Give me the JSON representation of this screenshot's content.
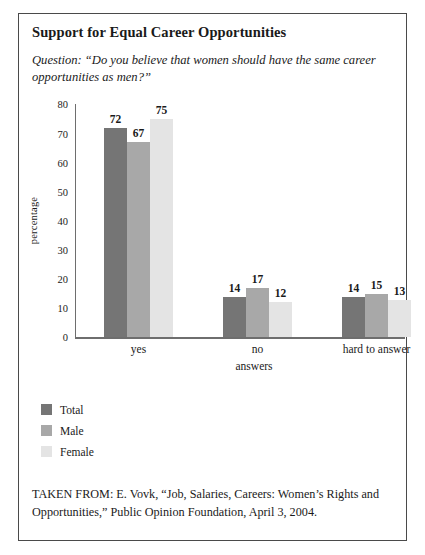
{
  "chart_title": "Support for Equal Career Opportunities",
  "question": "Question: “Do you believe that women should have the same career opportunities as men?”",
  "source": "TAKEN FROM: E. Vovk, “Job, Salaries, Careers: Women’s Rights and Opportunities,” Public Opinion Foundation, April 3, 2004.",
  "legend": {
    "items": [
      {
        "label": "Total",
        "color": "#757575"
      },
      {
        "label": "Male",
        "color": "#a8a8a8"
      },
      {
        "label": "Female",
        "color": "#e4e4e4"
      }
    ]
  },
  "chart_data": {
    "type": "bar",
    "title": "Support for Equal Career Opportunities",
    "xlabel": "answers",
    "ylabel": "percentage",
    "categories": [
      "yes",
      "no",
      "hard to answer"
    ],
    "series": [
      {
        "name": "Total",
        "color": "#757575",
        "values": [
          72,
          14,
          14
        ]
      },
      {
        "name": "Male",
        "color": "#a8a8a8",
        "values": [
          67,
          17,
          15
        ]
      },
      {
        "name": "Female",
        "color": "#e4e4e4",
        "values": [
          75,
          12,
          13
        ]
      }
    ],
    "ylim": [
      0,
      80
    ],
    "yticks": [
      0,
      10,
      20,
      30,
      40,
      50,
      60,
      70,
      80
    ],
    "grid": false,
    "legend_position": "below-plot-left",
    "value_labels": true
  }
}
